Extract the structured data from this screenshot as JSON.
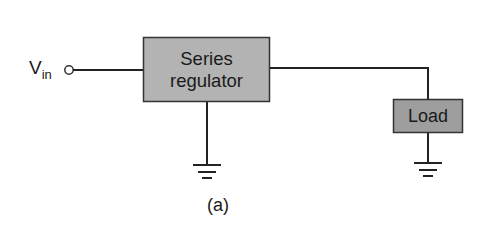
{
  "diagram": {
    "type": "block-diagram",
    "input": {
      "label": "V",
      "subscript": "in"
    },
    "blocks": [
      {
        "id": "series-regulator",
        "lines": [
          "Series",
          "regulator"
        ],
        "fill": "#b3b3b3"
      },
      {
        "id": "load",
        "label": "Load",
        "fill": "#9e9e9e"
      }
    ],
    "grounds": [
      "series-regulator",
      "load"
    ],
    "caption": "(a)",
    "colors": {
      "line": "#222222",
      "block_border": "#333333"
    }
  }
}
